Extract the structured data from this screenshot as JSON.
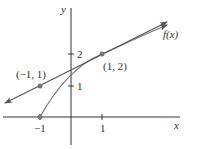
{
  "diagram": {
    "type": "function-graph-with-secant-line",
    "axes": {
      "x_label": "x",
      "y_label": "y",
      "x_ticks": [
        {
          "value": -1,
          "label": "−1"
        },
        {
          "value": 1,
          "label": "1"
        }
      ],
      "y_ticks": [
        {
          "value": 1,
          "label": "1"
        },
        {
          "value": 2,
          "label": "2"
        }
      ]
    },
    "curve_label": "f(x)",
    "points": [
      {
        "x": -1,
        "y": 1,
        "label": "(−1, 1)"
      },
      {
        "x": 1,
        "y": 2,
        "label": "(1, 2)"
      },
      {
        "x": -1,
        "y": 0,
        "label": ""
      }
    ],
    "line": {
      "through": [
        [
          -1,
          1
        ],
        [
          1,
          2
        ]
      ],
      "slope": 0.5,
      "intercept": 1.5
    },
    "colors": {
      "line": "#555555",
      "curve": "#777777",
      "axes": "#333333",
      "point": "#777777"
    }
  }
}
